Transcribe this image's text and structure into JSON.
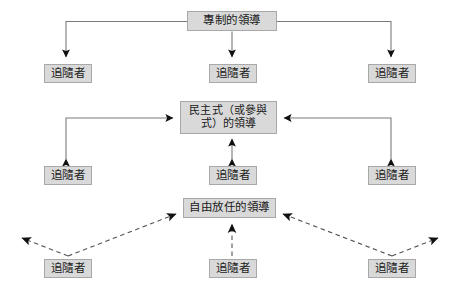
{
  "diagram": {
    "type": "leadership-styles-diagram",
    "background_color": "#ffffff",
    "node_fill_color": "#d9d9d9",
    "node_border_color": "#a8a8a8",
    "connector_color": "#6e6e6e",
    "arrowhead_color": "#111111",
    "nodes": {
      "autocratic": {
        "label": "專制的領導"
      },
      "democratic": {
        "label": "民主式（或參與\n式）的領導"
      },
      "laissez_faire": {
        "label": "自由放任的領導"
      },
      "followers": {
        "top_left": {
          "label": "追隨者"
        },
        "top_middle": {
          "label": "追隨者"
        },
        "top_right": {
          "label": "追隨者"
        },
        "middle_left": {
          "label": "追隨者"
        },
        "middle_middle": {
          "label": "追隨者"
        },
        "middle_right": {
          "label": "追隨者"
        },
        "bottom_left": {
          "label": "追隨者"
        },
        "bottom_middle": {
          "label": "追隨者"
        },
        "bottom_right": {
          "label": "追隨者"
        }
      }
    },
    "groups": [
      {
        "name": "autocratic-group",
        "line_style": "solid",
        "direction": "one-way-downward"
      },
      {
        "name": "democratic-group",
        "line_style": "solid",
        "direction": "two-way"
      },
      {
        "name": "laissez-faire-group",
        "line_style": "dashed",
        "direction": "outward-and-upward"
      }
    ]
  }
}
